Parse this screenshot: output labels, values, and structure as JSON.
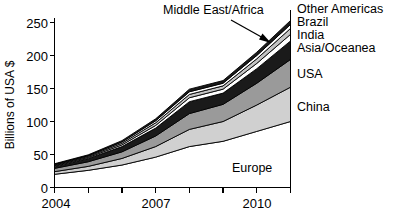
{
  "chart_data": {
    "type": "area",
    "title": "",
    "subtitle": "",
    "xlabel": "",
    "ylabel": "Billions of USA $",
    "xlim": [
      2004,
      2011
    ],
    "ylim": [
      0,
      260
    ],
    "grid": false,
    "legend_position": "right-inline-labels",
    "stacked": true,
    "x": [
      2004,
      2005,
      2006,
      2007,
      2008,
      2009,
      2010,
      2011
    ],
    "x_ticks": [
      2004,
      2005,
      2006,
      2007,
      2008,
      2009,
      2010,
      2011
    ],
    "x_tick_labels": [
      "2004",
      "",
      "",
      "2007",
      "",
      "",
      "2010",
      ""
    ],
    "y_ticks": [
      0,
      50,
      100,
      150,
      200,
      250
    ],
    "y_tick_labels": [
      "0",
      "50",
      "100",
      "150",
      "200",
      "250"
    ],
    "series": [
      {
        "name": "Europe",
        "fill": "#ffffff",
        "values": [
          20,
          26,
          34,
          46,
          62,
          70,
          85,
          100
        ]
      },
      {
        "name": "China",
        "fill": "#d0d0d0",
        "values": [
          4,
          6,
          10,
          16,
          26,
          30,
          40,
          52
        ]
      },
      {
        "name": "USA",
        "fill": "#9a9a9a",
        "values": [
          5,
          7,
          10,
          16,
          24,
          26,
          33,
          42
        ]
      },
      {
        "name": "Asia/Oceanea",
        "fill": "#1a1a1a",
        "values": [
          3,
          5,
          8,
          12,
          18,
          17,
          22,
          28
        ]
      },
      {
        "name": "India",
        "fill": "#ffffff",
        "values": [
          1,
          1.5,
          2.5,
          4,
          6,
          6,
          8,
          10
        ]
      },
      {
        "name": "Brazil",
        "fill": "#c4c4c4",
        "values": [
          1,
          1.5,
          2.5,
          4,
          5,
          5,
          7,
          9
        ]
      },
      {
        "name": "Other Americas",
        "fill": "#ffffff",
        "values": [
          1,
          1.2,
          2,
          3,
          4,
          4,
          5,
          6
        ]
      },
      {
        "name": "Middle East/Africa",
        "fill": "#1a1a1a",
        "values": [
          1,
          1.3,
          2,
          3,
          4,
          4,
          5,
          6
        ]
      }
    ],
    "totals": [
      36,
      49.5,
      71,
      104,
      149,
      162,
      205,
      253
    ],
    "annotations": [
      {
        "text": "Middle East/Africa",
        "target_x": 2010.1,
        "target_y": 240
      }
    ],
    "inline_labels": [
      {
        "text": "Europe",
        "position": "inside-bottom-band"
      },
      {
        "text": "China",
        "position": "right-of-axis"
      },
      {
        "text": "USA",
        "position": "right-of-axis"
      },
      {
        "text": "Asia/Oceanea",
        "position": "right-of-axis"
      },
      {
        "text": "India",
        "position": "right-of-axis"
      },
      {
        "text": "Brazil",
        "position": "right-of-axis"
      },
      {
        "text": "Other Americas",
        "position": "right-of-axis"
      }
    ]
  },
  "axis": {
    "y_title": "Billions of USA $",
    "y_ticks": [
      "250",
      "200",
      "150",
      "100",
      "50",
      "0"
    ],
    "x_ticks": [
      "2004",
      "2007",
      "2010"
    ]
  },
  "labels": {
    "other_americas": "Other Americas",
    "brazil": "Brazil",
    "india": "India",
    "asia_oceanea": "Asia/Oceanea",
    "usa": "USA",
    "china": "China",
    "europe": "Europe",
    "middle_east_africa": "Middle East/Africa"
  },
  "colors": {
    "axis": "#000000",
    "europe": "#ffffff",
    "china": "#d0d0d0",
    "usa": "#9a9a9a",
    "asia_oceanea": "#1a1a1a",
    "india": "#ffffff",
    "brazil": "#c4c4c4",
    "other_americas": "#ffffff",
    "middle_east_africa": "#1a1a1a"
  }
}
